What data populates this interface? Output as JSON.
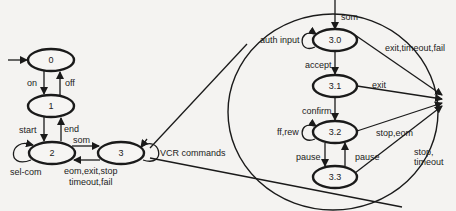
{
  "diagram": {
    "type": "state-transition",
    "states": [
      {
        "id": "0",
        "label": "0"
      },
      {
        "id": "1",
        "label": "1"
      },
      {
        "id": "2",
        "label": "2"
      },
      {
        "id": "3",
        "label": "3"
      },
      {
        "id": "3.0",
        "label": "3.0"
      },
      {
        "id": "3.1",
        "label": "3.1"
      },
      {
        "id": "3.2",
        "label": "3.2"
      },
      {
        "id": "3.3",
        "label": "3.3"
      }
    ],
    "edges": [
      {
        "from": "start",
        "to": "0",
        "label": ""
      },
      {
        "from": "0",
        "to": "1",
        "label": "on"
      },
      {
        "from": "1",
        "to": "0",
        "label": "off"
      },
      {
        "from": "1",
        "to": "2",
        "label": "start"
      },
      {
        "from": "2",
        "to": "1",
        "label": "end"
      },
      {
        "from": "2",
        "to": "2",
        "label": "sel-com"
      },
      {
        "from": "2",
        "to": "3",
        "label": "som"
      },
      {
        "from": "3",
        "to": "2",
        "label": "eom,exit,stop"
      },
      {
        "from": "3",
        "to": "2",
        "label_line2": "timeout,fail"
      },
      {
        "from": "3",
        "to": "3",
        "label": "VCR commands"
      },
      {
        "from": "entry",
        "to": "3.0",
        "label": "som"
      },
      {
        "from": "3.0",
        "to": "3.0",
        "label": "auth input"
      },
      {
        "from": "3.0",
        "to": "3.1",
        "label": "accept"
      },
      {
        "from": "3.0",
        "to": "exit",
        "label": "exit,timeout,fail"
      },
      {
        "from": "3.1",
        "to": "3.2",
        "label": "confirm"
      },
      {
        "from": "3.1",
        "to": "exit",
        "label": "exit"
      },
      {
        "from": "3.2",
        "to": "3.2",
        "label": "ff,rew"
      },
      {
        "from": "3.2",
        "to": "3.3",
        "label": "pause"
      },
      {
        "from": "3.3",
        "to": "3.2",
        "label": "pause"
      },
      {
        "from": "3.2",
        "to": "exit",
        "label": "stop,eom"
      },
      {
        "from": "3.3",
        "to": "exit",
        "label": "stop,"
      },
      {
        "from": "3.3",
        "to": "exit",
        "label_line2": "timeout"
      }
    ]
  },
  "labels": {
    "s0": "0",
    "s1": "1",
    "s2": "2",
    "s3": "3",
    "s30": "3.0",
    "s31": "3.1",
    "s32": "3.2",
    "s33": "3.3",
    "on": "on",
    "off": "off",
    "start": "start",
    "end": "end",
    "sel_com": "sel-com",
    "som": "som",
    "ret_line1": "eom,exit,stop",
    "ret_line2": "timeout,fail",
    "vcr": "VCR commands",
    "som_inner": "som",
    "auth": "auth input",
    "accept": "accept",
    "exit_tf": "exit,timeout,fail",
    "exit": "exit",
    "confirm": "confirm",
    "ffrew": "ff,rew",
    "pause_down": "pause",
    "pause_up": "pause",
    "stop_eom": "stop,eom",
    "stop_line1": "stop,",
    "stop_line2": "timeout"
  }
}
